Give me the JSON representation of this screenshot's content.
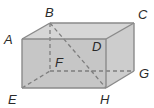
{
  "figure": {
    "type": "rectangular-prism",
    "vertices": {
      "A": [
        22,
        39
      ],
      "B": [
        50,
        23
      ],
      "C": [
        134,
        23
      ],
      "D": [
        106,
        39
      ],
      "E": [
        22,
        88
      ],
      "F": [
        50,
        71
      ],
      "G": [
        134,
        71
      ],
      "H": [
        106,
        88
      ]
    },
    "labels": [
      {
        "text": "A",
        "x": 4,
        "y": 44
      },
      {
        "text": "B",
        "x": 45,
        "y": 17
      },
      {
        "text": "C",
        "x": 138,
        "y": 19
      },
      {
        "text": "D",
        "x": 92,
        "y": 51
      },
      {
        "text": "E",
        "x": 8,
        "y": 104
      },
      {
        "text": "F",
        "x": 55,
        "y": 67
      },
      {
        "text": "G",
        "x": 139,
        "y": 78
      },
      {
        "text": "H",
        "x": 100,
        "y": 104
      }
    ],
    "hidden_edges": [
      "BF",
      "EF",
      "FG"
    ],
    "diagonal": "BH",
    "colors": {
      "front_face": "#c6c6c6",
      "top_face": "#d6d6d6",
      "side_face": "#cdcdcd",
      "edge": "#8a8a8a",
      "label": "#2a2a2a"
    }
  }
}
